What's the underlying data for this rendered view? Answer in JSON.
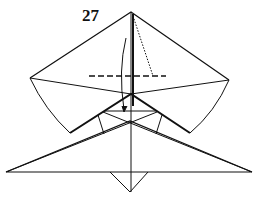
{
  "diagram": {
    "type": "origami-folding-step",
    "step_number": "27",
    "elements": [
      "upper-kite-flap",
      "center-crease",
      "valley-fold-line",
      "x-ray-dotted-line",
      "fold-arrow",
      "lower-triangle",
      "bottom-point-flap"
    ],
    "stroke_color": "#111111"
  }
}
